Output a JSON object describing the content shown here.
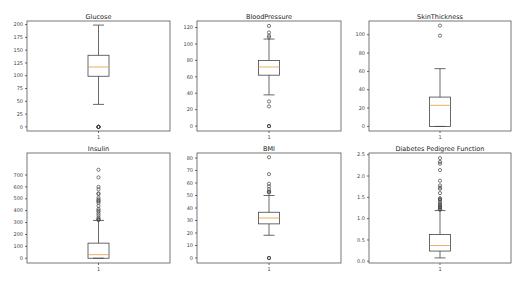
{
  "chart_data": [
    {
      "type": "box",
      "title": "Glucose",
      "xtick_labels": [
        "1"
      ],
      "ylim": [
        -8,
        207
      ],
      "yticks": [
        0,
        25,
        50,
        75,
        100,
        125,
        150,
        175,
        200
      ],
      "stats": {
        "q1": 99,
        "median": 117,
        "q3": 140,
        "whisker_low": 44,
        "whisker_high": 199
      },
      "outliers": [
        0,
        0,
        0,
        0,
        0
      ]
    },
    {
      "type": "box",
      "title": "BloodPressure",
      "xtick_labels": [
        "1"
      ],
      "ylim": [
        -6,
        128
      ],
      "yticks": [
        0,
        20,
        40,
        60,
        80,
        100,
        120
      ],
      "stats": {
        "q1": 62,
        "median": 72,
        "q3": 80,
        "whisker_low": 38,
        "whisker_high": 106
      },
      "outliers": [
        0,
        0,
        0,
        24,
        30,
        108,
        110,
        114,
        122
      ]
    },
    {
      "type": "box",
      "title": "SkinThickness",
      "xtick_labels": [
        "1"
      ],
      "ylim": [
        -5,
        115
      ],
      "yticks": [
        0,
        20,
        40,
        60,
        80,
        100
      ],
      "stats": {
        "q1": 0,
        "median": 23,
        "q3": 32,
        "whisker_low": 0,
        "whisker_high": 63
      },
      "outliers": [
        99,
        110
      ]
    },
    {
      "type": "box",
      "title": "Insulin",
      "xtick_labels": [
        "1"
      ],
      "ylim": [
        -40,
        885
      ],
      "yticks": [
        0,
        100,
        200,
        300,
        400,
        500,
        600,
        700
      ],
      "stats": {
        "q1": 0,
        "median": 30,
        "q3": 127,
        "whisker_low": 0,
        "whisker_high": 318
      },
      "outliers": [
        321,
        325,
        330,
        342,
        360,
        375,
        392,
        402,
        415,
        440,
        465,
        478,
        485,
        495,
        510,
        540,
        545,
        579,
        600,
        680,
        744
      ]
    },
    {
      "type": "box",
      "title": "BMI",
      "xtick_labels": [
        "1"
      ],
      "ylim": [
        -4,
        84
      ],
      "yticks": [
        0,
        10,
        20,
        30,
        40,
        50,
        60,
        70,
        80
      ],
      "stats": {
        "q1": 27.3,
        "median": 32,
        "q3": 36.6,
        "whisker_low": 18.2,
        "whisker_high": 50
      },
      "outliers": [
        0,
        0,
        0,
        52.3,
        52.9,
        53.2,
        55,
        57.3,
        59.4,
        67.1,
        80.6
      ]
    },
    {
      "type": "box",
      "title": "Diabetes Pedigree Function",
      "xtick_labels": [
        "1"
      ],
      "ylim": [
        -0.04,
        2.54
      ],
      "yticks": [
        0.0,
        0.5,
        1.0,
        1.5,
        2.0,
        2.5
      ],
      "stats": {
        "q1": 0.24,
        "median": 0.37,
        "q3": 0.63,
        "whisker_low": 0.08,
        "whisker_high": 1.19
      },
      "outliers": [
        1.21,
        1.22,
        1.25,
        1.27,
        1.3,
        1.32,
        1.35,
        1.39,
        1.44,
        1.46,
        1.48,
        1.6,
        1.7,
        1.73,
        1.78,
        1.89,
        2.14,
        2.29,
        2.33,
        2.42
      ]
    }
  ],
  "colors": {
    "frame": "#555555",
    "box": "#444444",
    "median": "#e69a3c",
    "text": "#222222"
  }
}
